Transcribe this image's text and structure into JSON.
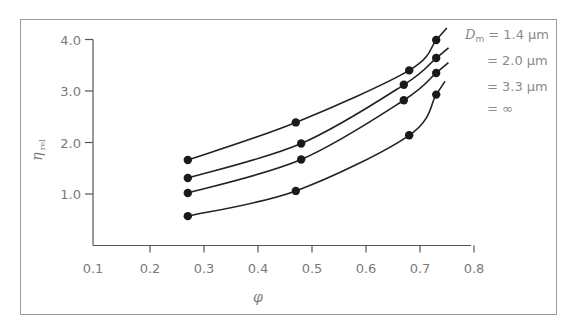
{
  "chart_data": {
    "type": "line",
    "title": "",
    "xlabel": "φ",
    "ylabel": "η rel",
    "ylabel_main": "η",
    "ylabel_sub": "rel",
    "xlim": [
      0.1,
      0.8
    ],
    "ylim": [
      0,
      4.0
    ],
    "xticks": [
      "0.1",
      "0.2",
      "0.3",
      "0.4",
      "0.5",
      "0.6",
      "0.7",
      "0.8"
    ],
    "yticks": [
      "1.0",
      "2.0",
      "3.0",
      "4.0"
    ],
    "grid": false,
    "legend_position": "top-right",
    "legend_prefix": "D",
    "legend_prefix_sub": "m",
    "series": [
      {
        "name": "Dm = 1.4 μm",
        "label": "= 1.4 μm",
        "x": [
          0.27,
          0.47,
          0.68,
          0.73
        ],
        "y": [
          1.66,
          2.39,
          3.4,
          3.99
        ]
      },
      {
        "name": "Dm = 2.0 μm",
        "label": "= 2.0 μm",
        "x": [
          0.27,
          0.48,
          0.67,
          0.73
        ],
        "y": [
          1.31,
          1.98,
          3.12,
          3.64
        ]
      },
      {
        "name": "Dm = 3.3 μm",
        "label": "= 3.3 μm",
        "x": [
          0.27,
          0.48,
          0.67,
          0.73
        ],
        "y": [
          1.02,
          1.67,
          2.82,
          3.35
        ]
      },
      {
        "name": "Dm = ∞",
        "label": "= ∞",
        "x": [
          0.27,
          0.47,
          0.68,
          0.73
        ],
        "y": [
          0.57,
          1.06,
          2.14,
          2.93
        ]
      }
    ]
  },
  "colors": {
    "frame": "#9a9a9a",
    "axis": "#555555",
    "curve": "#222222",
    "marker": "#1a1a1a",
    "text": "#7a7a7a"
  }
}
